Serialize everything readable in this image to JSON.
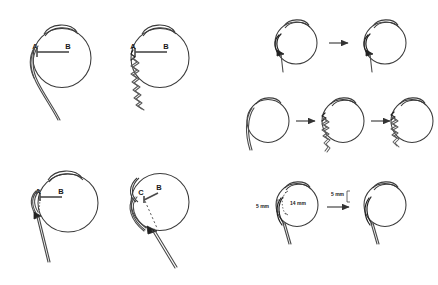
{
  "figure": {
    "background_color": "#ffffff",
    "line_color": "#3b3b3b",
    "accent_color": "#222222",
    "width": 438,
    "height": 285
  },
  "panels": [
    {
      "id": "panel-top-left",
      "position": "top-left",
      "labels": [
        {
          "name": "point-a",
          "text": "A"
        },
        {
          "name": "point-b",
          "text": "B"
        }
      ],
      "elements": [
        "eye-globe",
        "cornea-arc",
        "measure-line-a-b",
        "smooth-double-thread"
      ]
    },
    {
      "id": "panel-top-right",
      "position": "top-right",
      "labels": [
        {
          "name": "point-a",
          "text": "A"
        },
        {
          "name": "point-b",
          "text": "B"
        }
      ],
      "elements": [
        "eye-globe",
        "cornea-arc",
        "measure-line-a-b",
        "zigzag-thread"
      ]
    },
    {
      "id": "panel-bottom-left",
      "position": "bottom-left",
      "labels": [
        {
          "name": "point-a",
          "text": "A"
        },
        {
          "name": "point-b",
          "text": "B"
        }
      ],
      "elements": [
        "eye-globe",
        "cornea-arc",
        "measure-line-a-b",
        "dotted-drop-line",
        "needle-arrow-entry",
        "suture-tail"
      ]
    },
    {
      "id": "panel-bottom-right",
      "position": "bottom-right",
      "labels": [
        {
          "name": "point-c",
          "text": "C"
        },
        {
          "name": "point-b",
          "text": "B"
        }
      ],
      "elements": [
        "eye-globe-rotated",
        "cornea-arc-rotated",
        "measure-line-c-b",
        "dashed-drop-line",
        "needle-arrow-entry",
        "suture-tail"
      ]
    },
    {
      "id": "panel-right-row-1",
      "position": "right-top",
      "labels": [],
      "elements": [
        "small-eye-with-hook-suture",
        "progress-arrow",
        "small-eye-with-hook-suture"
      ]
    },
    {
      "id": "panel-right-row-2",
      "position": "right-middle",
      "labels": [],
      "elements": [
        "small-eye-smooth-thread",
        "progress-arrow",
        "small-eye-zigzag-thread",
        "progress-arrow",
        "small-eye-short-zigzag-thread"
      ]
    },
    {
      "id": "panel-right-row-3",
      "position": "right-bottom",
      "labels": [
        {
          "name": "measure-label-outer",
          "text": "5 mm"
        },
        {
          "name": "measure-label-inner",
          "text": "14 mm"
        },
        {
          "name": "measure-label-result",
          "text": "5 mm"
        }
      ],
      "elements": [
        "small-eye-with-measures",
        "progress-arrow",
        "small-eye-with-measure"
      ]
    }
  ]
}
